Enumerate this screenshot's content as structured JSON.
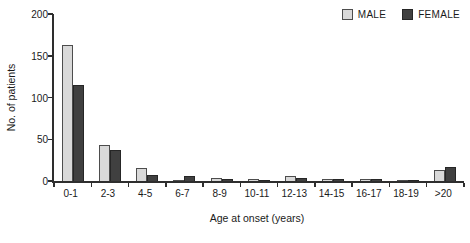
{
  "chart_data": {
    "type": "bar",
    "title": "",
    "xlabel": "Age at onset (years)",
    "ylabel": "No. of patients",
    "ylim": [
      0,
      200
    ],
    "yticks": [
      0,
      50,
      100,
      150,
      200
    ],
    "grid": false,
    "legend_position": "top-right",
    "categories": [
      "0-1",
      "2-3",
      "4-5",
      "6-7",
      "8-9",
      "10-11",
      "12-13",
      "14-15",
      "16-17",
      "18-19",
      ">20"
    ],
    "series": [
      {
        "name": "MALE",
        "color": "#d9d9d9",
        "border": "#4d4d4d",
        "values": [
          163,
          43,
          16,
          1,
          4,
          2,
          6,
          3,
          3,
          1,
          13
        ]
      },
      {
        "name": "FEMALE",
        "color": "#404040",
        "border": "#262626",
        "values": [
          115,
          37,
          7,
          6,
          2,
          1,
          4,
          2,
          2,
          1,
          17
        ]
      }
    ]
  },
  "colors": {
    "axis": "#2e2e2e",
    "text": "#1a1a1a",
    "background": "#ffffff"
  }
}
